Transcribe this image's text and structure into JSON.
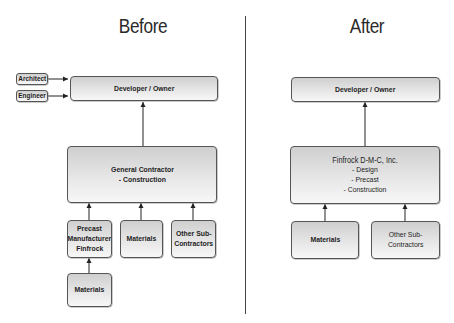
{
  "before": {
    "title": "Before",
    "architect": "Architect",
    "engineer": "Engineer",
    "developer_owner": "Developer / Owner",
    "general_contractor": [
      "General Contractor",
      "- Construction"
    ],
    "precast": [
      "Precast",
      "Manufacturer",
      "Finfrock"
    ],
    "materials_mid": "Materials",
    "other_sub": [
      "Other Sub-",
      "Contractors"
    ],
    "materials_bottom": "Materials"
  },
  "after": {
    "title": "After",
    "developer_owner": "Developer / Owner",
    "finfrock": [
      "Finfrock D-M-C, Inc.",
      "- Design",
      "- Precast",
      "- Construction"
    ],
    "materials": "Materials",
    "other_sub": [
      "Other Sub-",
      "Contractors"
    ]
  },
  "colors": {
    "border": "#555555",
    "arrow": "#222222",
    "divider": "#444444"
  }
}
